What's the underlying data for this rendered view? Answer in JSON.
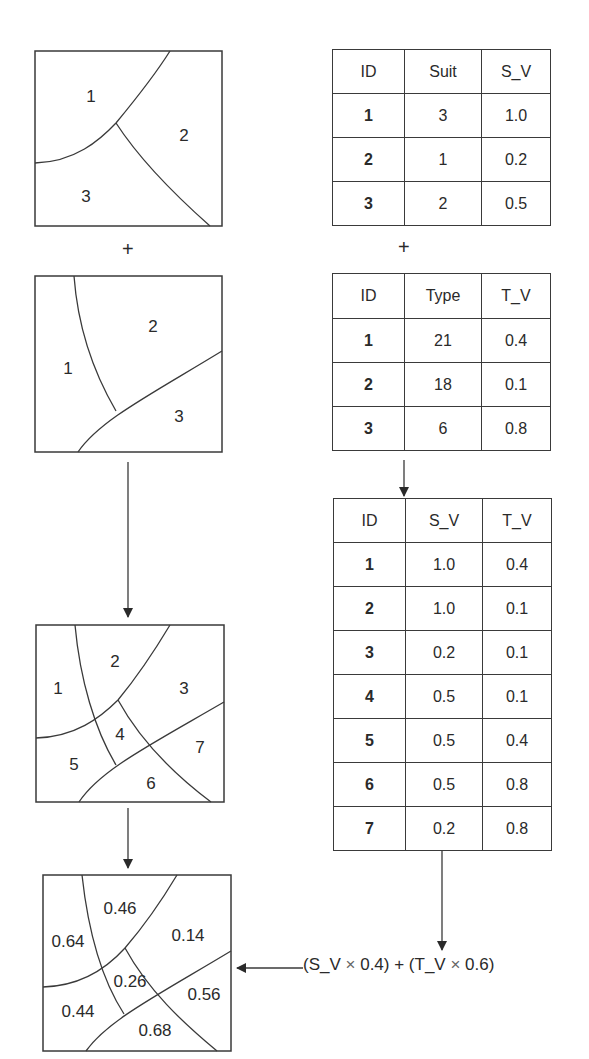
{
  "maps": {
    "suitability_map": {
      "labels": [
        "1",
        "2",
        "3"
      ]
    },
    "type_map": {
      "labels": [
        "1",
        "2",
        "3"
      ]
    },
    "overlay_map": {
      "labels": [
        "1",
        "2",
        "3",
        "4",
        "5",
        "6",
        "7"
      ]
    },
    "result_map": {
      "labels": [
        "0.64",
        "0.46",
        "0.14",
        "0.26",
        "0.44",
        "0.68",
        "0.56"
      ]
    }
  },
  "operators": {
    "plus_left": "+",
    "plus_right": "+"
  },
  "tables": {
    "suitability": {
      "headers": [
        "ID",
        "Suit",
        "S_V"
      ],
      "rows": [
        [
          "1",
          "3",
          "1.0"
        ],
        [
          "2",
          "1",
          "0.2"
        ],
        [
          "3",
          "2",
          "0.5"
        ]
      ]
    },
    "type": {
      "headers": [
        "ID",
        "Type",
        "T_V"
      ],
      "rows": [
        [
          "1",
          "21",
          "0.4"
        ],
        [
          "2",
          "18",
          "0.1"
        ],
        [
          "3",
          "6",
          "0.8"
        ]
      ]
    },
    "combined": {
      "headers": [
        "ID",
        "S_V",
        "T_V"
      ],
      "rows": [
        [
          "1",
          "1.0",
          "0.4"
        ],
        [
          "2",
          "1.0",
          "0.1"
        ],
        [
          "3",
          "0.2",
          "0.1"
        ],
        [
          "4",
          "0.5",
          "0.1"
        ],
        [
          "5",
          "0.5",
          "0.4"
        ],
        [
          "6",
          "0.5",
          "0.8"
        ],
        [
          "7",
          "0.2",
          "0.8"
        ]
      ]
    }
  },
  "formula": {
    "part1": "(S_V ",
    "times1": "×",
    "part2": " 0.4) + (T_V ",
    "times2": "×",
    "part3": " 0.6)"
  }
}
